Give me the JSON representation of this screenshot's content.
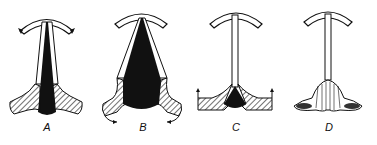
{
  "figure": {
    "panels": [
      {
        "id": "A",
        "label": "A"
      },
      {
        "id": "B",
        "label": "B"
      },
      {
        "id": "C",
        "label": "C"
      },
      {
        "id": "D",
        "label": "D"
      }
    ],
    "colors": {
      "ink": "#111111",
      "background": "#ffffff"
    }
  }
}
